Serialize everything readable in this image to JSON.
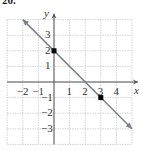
{
  "problem_label": "20.",
  "chart_data": {
    "type": "line",
    "title": "",
    "xlabel": "x",
    "ylabel": "y",
    "xlim": [
      -3,
      5
    ],
    "ylim": [
      -4,
      4
    ],
    "grid": true,
    "x_ticks": [
      -2,
      -1,
      1,
      2,
      3,
      4
    ],
    "y_ticks": [
      3,
      2,
      1,
      -1,
      -2,
      -3
    ],
    "series": [
      {
        "name": "line",
        "equation": "y = -x + 2",
        "x": [
          -2,
          5
        ],
        "y": [
          4,
          -3
        ],
        "arrows": "both"
      }
    ],
    "points": [
      {
        "x": 0,
        "y": 2
      },
      {
        "x": 3,
        "y": -1
      }
    ],
    "colors": {
      "line": "#7a7f8a",
      "grid": "#c8c8c8",
      "axis": "#555555",
      "point": "#000000"
    }
  }
}
